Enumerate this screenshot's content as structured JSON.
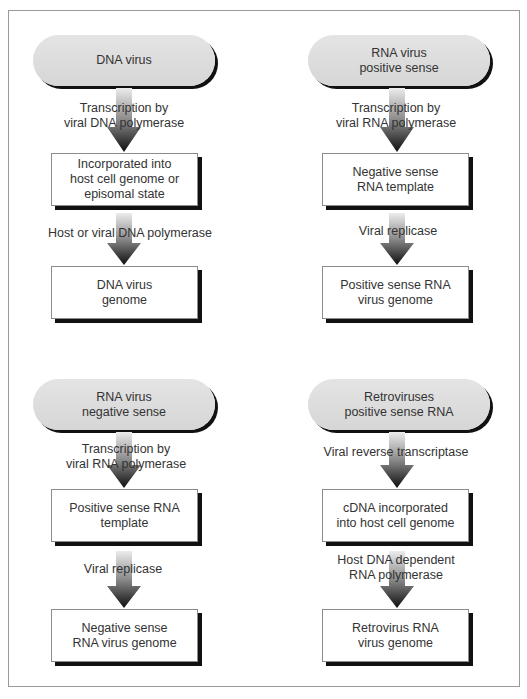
{
  "diagram": {
    "panels": [
      {
        "id": "dna-virus",
        "start": [
          "DNA virus"
        ],
        "step1_label": [
          "Transcription by",
          "viral DNA polymerase"
        ],
        "middle": [
          "Incorporated into",
          "host cell genome or",
          "episomal state"
        ],
        "step2_label": [
          "Host or viral DNA polymerase"
        ],
        "end": [
          "DNA virus",
          "genome"
        ]
      },
      {
        "id": "rna-positive",
        "start": [
          "RNA virus",
          "positive sense"
        ],
        "step1_label": [
          "Transcription by",
          "viral RNA polymerase"
        ],
        "middle": [
          "Negative sense",
          "RNA template"
        ],
        "step2_label": [
          "Viral replicase"
        ],
        "end": [
          "Positive sense RNA",
          "virus genome"
        ]
      },
      {
        "id": "rna-negative",
        "start": [
          "RNA virus",
          "negative sense"
        ],
        "step1_label": [
          "Transcription by",
          "viral RNA polymerase"
        ],
        "middle": [
          "Positive sense RNA",
          "template"
        ],
        "step2_label": [
          "Viral replicase"
        ],
        "end": [
          "Negative sense",
          "RNA virus genome"
        ]
      },
      {
        "id": "retrovirus",
        "start": [
          "Retroviruses",
          "positive sense RNA"
        ],
        "step1_label": [
          "Viral reverse transcriptase"
        ],
        "middle": [
          "cDNA incorporated",
          "into host cell genome"
        ],
        "step2_label": [
          "Host DNA dependent",
          "RNA polymerase"
        ],
        "end": [
          "Retrovirus RNA",
          "virus genome"
        ]
      }
    ],
    "colors": {
      "pill_fill": "#dcdcdc",
      "shadow": "#111111",
      "arrow_top": "#e6e6e6",
      "arrow_bottom": "#111111",
      "frame": "#9a9a9a"
    }
  }
}
